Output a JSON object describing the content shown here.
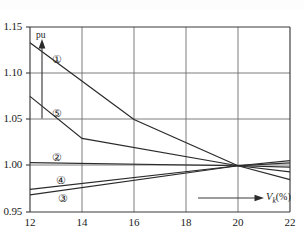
{
  "chart_data": {
    "type": "line",
    "title": "",
    "subtitle": "",
    "xlabel": "Vk(%)",
    "xlabel_symbol": "V",
    "xlabel_subscript": "k",
    "xlabel_unit": "(%)",
    "ylabel": "pu",
    "xlim": [
      12,
      22
    ],
    "ylim": [
      0.95,
      1.15
    ],
    "xticks": [
      12,
      14,
      16,
      18,
      20,
      22
    ],
    "xticklabels": [
      "12",
      "14",
      "16",
      "18",
      "20",
      "22"
    ],
    "yticks": [
      0.95,
      1.0,
      1.05,
      1.1,
      1.15
    ],
    "yticklabels": [
      "0.95",
      "1.00",
      "1.05",
      "1.10",
      "1.15"
    ],
    "grid": true,
    "grid_x": [
      14,
      16,
      18,
      20
    ],
    "grid_y": [
      1.0,
      1.05,
      1.1
    ],
    "legend": "none",
    "legend_position": "inline-annotations",
    "line_color": "#2b2b2b",
    "grid_color": "#6e6e6e",
    "axis_color": "#3a3a3a",
    "series": [
      {
        "name": "1",
        "label": "①",
        "x": [
          12,
          16,
          20,
          22
        ],
        "y": [
          1.133,
          1.05,
          1.0,
          0.985
        ],
        "label_x": 13.05,
        "label_y": 1.113
      },
      {
        "name": "2",
        "label": "②",
        "x": [
          12,
          20,
          22
        ],
        "y": [
          1.0035,
          1.0,
          0.9985
        ],
        "label_x": 13.05,
        "label_y": 1.0075
      },
      {
        "name": "3",
        "label": "③",
        "x": [
          12,
          20,
          22
        ],
        "y": [
          0.9685,
          1.0,
          1.0055
        ],
        "label_x": 13.25,
        "label_y": 0.9625
      },
      {
        "name": "4",
        "label": "④",
        "x": [
          12,
          20,
          22
        ],
        "y": [
          0.9745,
          1.0,
          1.003
        ],
        "label_x": 13.2,
        "label_y": 0.9825
      },
      {
        "name": "5",
        "label": "⑤",
        "x": [
          12,
          14,
          20,
          22
        ],
        "y": [
          1.075,
          1.0295,
          1.0,
          0.9935
        ],
        "label_x": 13.05,
        "label_y": 1.0545
      }
    ],
    "annotations": [
      {
        "name": "pu-arrow",
        "type": "vertical-arrow",
        "text": "pu",
        "x": 12.45,
        "y_start": 1.0665,
        "y_end": 1.1405
      },
      {
        "name": "vk-arrow",
        "type": "horizontal-arrow",
        "text": "Vk(%)",
        "x_start": 17.25,
        "x_end": 20.8,
        "y": 0.9635
      }
    ]
  },
  "axis": {
    "y_labels": [
      "1.15",
      "1.10",
      "1.05",
      "1.00",
      "0.95"
    ],
    "x_labels": [
      "12",
      "14",
      "16",
      "18",
      "20",
      "22"
    ],
    "y_unit": "pu",
    "x_name_symbol": "V",
    "x_name_sub": "k",
    "x_name_unit": "(%)"
  },
  "curve_tags": [
    {
      "id": "curve-tag-1",
      "label": "①"
    },
    {
      "id": "curve-tag-5",
      "label": "⑤"
    },
    {
      "id": "curve-tag-2",
      "label": "②"
    },
    {
      "id": "curve-tag-4",
      "label": "④"
    },
    {
      "id": "curve-tag-3",
      "label": "③"
    }
  ]
}
